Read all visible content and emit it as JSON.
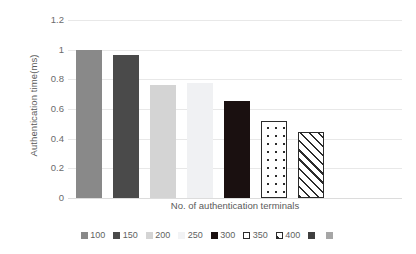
{
  "chart_data": {
    "type": "bar",
    "title": "",
    "xlabel": "No. of authentication terminals",
    "ylabel": "Authentication time(ms)",
    "categories": [
      "100",
      "150",
      "200",
      "250",
      "300",
      "350",
      "400"
    ],
    "values": [
      1.0,
      0.965,
      0.765,
      0.775,
      0.655,
      0.52,
      0.445
    ],
    "ylim": [
      0,
      1.2
    ],
    "yticks": [
      "0",
      "0.2",
      "0.4",
      "0.6",
      "0.8",
      "1",
      "1.2"
    ],
    "ytick_values": [
      0,
      0.2,
      0.4,
      0.6,
      0.8,
      1,
      1.2
    ],
    "grid": true,
    "legend_position": "bottom",
    "series": [
      {
        "name": "Authentication time",
        "values": [
          1.0,
          0.965,
          0.765,
          0.775,
          0.655,
          0.52,
          0.445
        ]
      }
    ],
    "bar_styles": [
      {
        "category": "100",
        "fill": "#898989",
        "pattern": "solid",
        "border": "none"
      },
      {
        "category": "150",
        "fill": "#4a4a4a",
        "pattern": "solid",
        "border": "none"
      },
      {
        "category": "200",
        "fill": "#d4d4d4",
        "pattern": "solid",
        "border": "none"
      },
      {
        "category": "250",
        "fill": "#f0f1f3",
        "pattern": "solid",
        "border": "none"
      },
      {
        "category": "300",
        "fill": "#1a1010",
        "pattern": "solid",
        "border": "none"
      },
      {
        "category": "350",
        "fill": "#ffffff",
        "pattern": "dots",
        "border": "#2b2b2b"
      },
      {
        "category": "400",
        "fill": "#ffffff",
        "pattern": "diagonal-stripes",
        "border": "#2b2b2b"
      }
    ]
  },
  "axes": {
    "y_title": "Authentication time(ms)",
    "x_title": "No. of authentication terminals",
    "y_labels": [
      "1.2",
      "1",
      "0.8",
      "0.6",
      "0.4",
      "0.2",
      "0"
    ]
  },
  "legend": {
    "items": [
      {
        "label": "100",
        "fill": "#898989",
        "pattern": "solid",
        "border": "none"
      },
      {
        "label": "150",
        "fill": "#4a4a4a",
        "pattern": "solid",
        "border": "none"
      },
      {
        "label": "200",
        "fill": "#d4d4d4",
        "pattern": "solid",
        "border": "none"
      },
      {
        "label": "250",
        "fill": "#f2f3f5",
        "pattern": "solid",
        "border": "none"
      },
      {
        "label": "300",
        "fill": "#1a1010",
        "pattern": "solid",
        "border": "none"
      },
      {
        "label": "350",
        "fill": "#ffffff",
        "pattern": "dots",
        "border": "#2b2b2b"
      },
      {
        "label": "400",
        "fill": "#ffffff",
        "pattern": "diagonal-stripes",
        "border": "#2b2b2b"
      },
      {
        "label": "",
        "fill": "#3f3f3f",
        "pattern": "solid",
        "border": "none"
      },
      {
        "label": "",
        "fill": "#a6a6a6",
        "pattern": "solid",
        "border": "none"
      }
    ]
  },
  "colors": {
    "gridline": "#e8e8e8",
    "baseline": "#dcdcdc",
    "text": "#5a5a5a",
    "background": "#ffffff"
  }
}
